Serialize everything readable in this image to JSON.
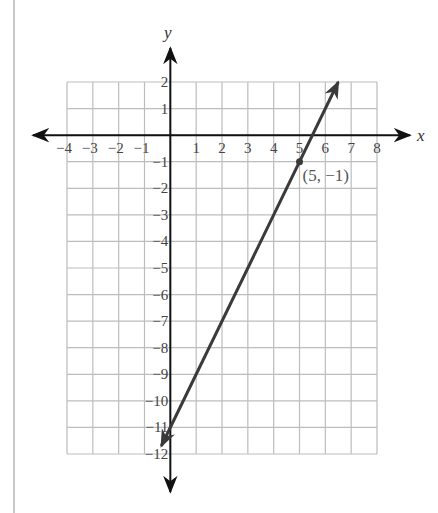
{
  "chart_data": {
    "type": "line",
    "title": "",
    "xlabel": "x",
    "ylabel": "y",
    "xlim": [
      -4,
      8
    ],
    "ylim": [
      -12,
      2
    ],
    "grid": true,
    "x_ticks": [
      -4,
      -3,
      -2,
      -1,
      1,
      2,
      3,
      4,
      5,
      6,
      7,
      8
    ],
    "y_ticks": [
      2,
      1,
      -1,
      -2,
      -3,
      -4,
      -5,
      -6,
      -7,
      -8,
      -9,
      -10,
      -11,
      -12
    ],
    "series": [
      {
        "name": "line",
        "equation": "y = 2x - 11",
        "slope": 2,
        "intercept": -11,
        "x": [
          -0.35,
          6.5
        ],
        "y": [
          -11.7,
          2
        ],
        "arrows": "both",
        "color": "#3a3a3a"
      }
    ],
    "annotations": [
      {
        "x": 5,
        "y": -1,
        "label": "(5, −1)",
        "marker": "dot"
      }
    ]
  },
  "colors": {
    "grid": "#bdbdbd",
    "axes": "#111111",
    "line": "#3a3a3a",
    "page_border": "#c8c8c8"
  },
  "labels": {
    "x_axis": "x",
    "y_axis": "y",
    "point": "(5, −1)"
  }
}
